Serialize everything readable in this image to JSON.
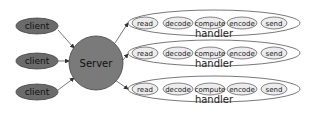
{
  "diagram": {
    "clients": [
      {
        "label": "client"
      },
      {
        "label": "client"
      },
      {
        "label": "client"
      }
    ],
    "server": {
      "label": "Server"
    },
    "handlers": [
      {
        "label": "handler",
        "stages": [
          "read",
          "decode",
          "compute",
          "encode",
          "send"
        ]
      },
      {
        "label": "handler",
        "stages": [
          "read",
          "decode",
          "compute",
          "encode",
          "send"
        ]
      },
      {
        "label": "handler",
        "stages": [
          "read",
          "decode",
          "compute",
          "encode",
          "send"
        ]
      }
    ],
    "colors": {
      "client_fill": "#6b6b6b",
      "server_fill": "#7a7a7a",
      "stage_fill": "#ececec",
      "stroke": "#444444"
    }
  }
}
